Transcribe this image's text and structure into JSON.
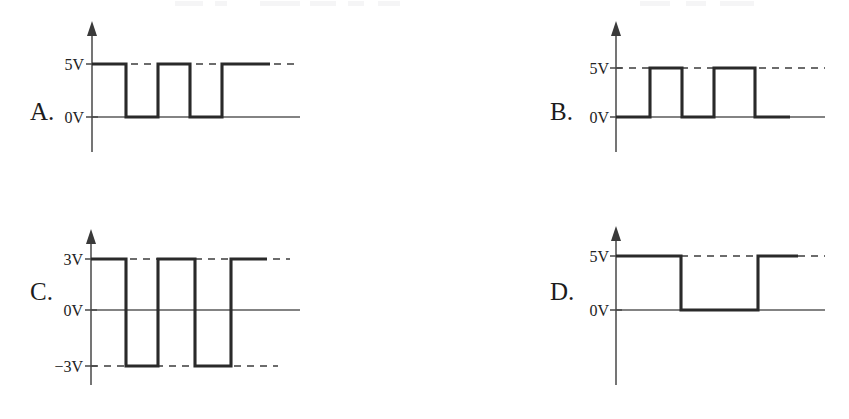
{
  "figure": {
    "kind": "square-wave-timing-diagrams",
    "background_color": "#ffffff",
    "ink_color": "#2a2a2a",
    "axis_color": "#474747",
    "width": 849,
    "height": 419
  },
  "top_crop_artifact": {
    "visible": true,
    "text": "",
    "note": "faint clipped text remnants along the very top edge of the scan"
  },
  "panels": [
    {
      "id": "A",
      "letter": "A.",
      "letter_x": 30,
      "letter_y": 120,
      "axis_x": 92,
      "axis_top_y": 30,
      "axis_bottom_y": 152,
      "baseline_y": 117,
      "baseline_x_end": 300,
      "levels": [
        {
          "label": "5V",
          "value": 5,
          "y": 64,
          "label_x": 84,
          "dashed": true,
          "dash_x_end": 300
        },
        {
          "label": "0V",
          "value": 0,
          "y": 117,
          "label_x": 84,
          "dashed": false,
          "dash_x_end": 300
        }
      ],
      "waveform": {
        "starts_high": true,
        "high_y": 64,
        "low_y": 117,
        "x_start": 92,
        "x_end": 270,
        "transitions": [
          126,
          158,
          190,
          222,
          233
        ],
        "points": "92,64 126,64 126,117 158,117 158,64 190,64 190,117 222,117 222,64 270,64"
      }
    },
    {
      "id": "B",
      "letter": "B.",
      "letter_x": 550,
      "letter_y": 120,
      "axis_x": 616,
      "axis_top_y": 30,
      "axis_bottom_y": 152,
      "baseline_y": 117,
      "baseline_x_end": 825,
      "levels": [
        {
          "label": "5V",
          "value": 5,
          "y": 68,
          "label_x": 609,
          "dashed": true,
          "dash_x_end": 825
        },
        {
          "label": "0V",
          "value": 0,
          "y": 117,
          "label_x": 609,
          "dashed": false,
          "dash_x_end": 825
        }
      ],
      "waveform": {
        "starts_high": false,
        "high_y": 68,
        "low_y": 117,
        "x_start": 616,
        "x_end": 790,
        "transitions": [
          650,
          682,
          714,
          746
        ],
        "points": "616,117 650,117 650,68 682,68 682,117 714,117 714,68 755,68 755,117 790,117"
      }
    },
    {
      "id": "C",
      "letter": "C.",
      "letter_x": 30,
      "letter_y": 300,
      "axis_x": 91,
      "axis_top_y": 238,
      "axis_bottom_y": 385,
      "baseline_y": 310,
      "baseline_x_end": 300,
      "levels": [
        {
          "label": "3V",
          "value": 3,
          "y": 259,
          "label_x": 83,
          "dashed": true,
          "dash_x_end": 290
        },
        {
          "label": "0V",
          "value": 0,
          "y": 310,
          "label_x": 83,
          "dashed": false,
          "dash_x_end": 300
        },
        {
          "label": "−3V",
          "value": -3,
          "y": 366,
          "label_x": 83,
          "dashed": true,
          "dash_x_end": 278
        }
      ],
      "waveform": {
        "starts_high": true,
        "high_y": 259,
        "low_y": 366,
        "x_start": 91,
        "x_end": 267,
        "transitions": [
          126,
          158,
          195,
          231
        ],
        "points": "91,259 126,259 126,366 158,366 158,259 195,259 195,366 231,366 231,259 267,259"
      }
    },
    {
      "id": "D",
      "letter": "D.",
      "letter_x": 550,
      "letter_y": 300,
      "axis_x": 616,
      "axis_top_y": 235,
      "axis_bottom_y": 385,
      "baseline_y": 310,
      "baseline_x_end": 825,
      "levels": [
        {
          "label": "5V",
          "value": 5,
          "y": 256,
          "label_x": 609,
          "dashed": true,
          "dash_x_end": 825
        },
        {
          "label": "0V",
          "value": 0,
          "y": 310,
          "label_x": 609,
          "dashed": false,
          "dash_x_end": 825
        }
      ],
      "waveform": {
        "starts_high": true,
        "high_y": 256,
        "low_y": 310,
        "x_start": 616,
        "x_end": 798,
        "transitions": [
          681,
          758
        ],
        "points": "616,256 681,256 681,310 758,310 758,256 798,256"
      }
    }
  ]
}
